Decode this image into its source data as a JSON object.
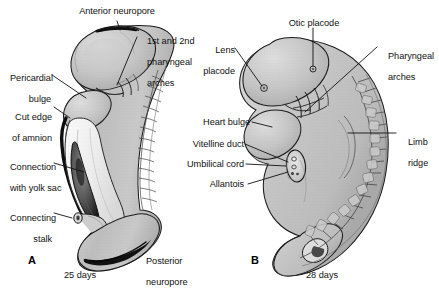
{
  "figure": {
    "background": "#ffffff",
    "ink": "#111111",
    "panels": [
      {
        "id": "A",
        "letter": "A",
        "caption": "25 days",
        "labels": [
          {
            "key": "anterior_neuropore",
            "text": "Anterior neuropore"
          },
          {
            "key": "pharyngeal_arches_1_2",
            "text": "1st and 2nd\npharyngeal\narches"
          },
          {
            "key": "pericardial_bulge",
            "text": "Pericardial\nbulge"
          },
          {
            "key": "cut_edge_of_amnion",
            "text": "Cut edge\nof amnion"
          },
          {
            "key": "connection_with_yolk_sac",
            "text": "Connection\nwith yolk sac"
          },
          {
            "key": "connecting_stalk",
            "text": "Connecting\nstalk"
          },
          {
            "key": "posterior_neuropore",
            "text": "Posterior\nneuropore"
          }
        ]
      },
      {
        "id": "B",
        "letter": "B",
        "caption": "28 days",
        "labels": [
          {
            "key": "otic_placode",
            "text": "Otic placode"
          },
          {
            "key": "lens_placode",
            "text": "Lens\nplacode"
          },
          {
            "key": "pharyngeal_arches",
            "text": "Pharyngeal\narches"
          },
          {
            "key": "heart_bulge",
            "text": "Heart bulge"
          },
          {
            "key": "vitelline_duct",
            "text": "Vitelline duct"
          },
          {
            "key": "umbilical_cord",
            "text": "Umbilical cord"
          },
          {
            "key": "allantois",
            "text": "Allantois"
          },
          {
            "key": "limb_ridge",
            "text": "Limb\nridge"
          }
        ]
      }
    ]
  },
  "panelA": {
    "letter": "A",
    "days": "25 days",
    "anterior_neuropore": "Anterior neuropore",
    "pharyngeal_arches_line1": "1st and 2nd",
    "pharyngeal_arches_line2": "pharyngeal",
    "pharyngeal_arches_line3": "arches",
    "pericardial_line1": "Pericardial",
    "pericardial_line2": "bulge",
    "cut_edge_line1": "Cut edge",
    "cut_edge_line2": "of amnion",
    "yolk_sac_line1": "Connection",
    "yolk_sac_line2": "with yolk sac",
    "connecting_stalk_line1": "Connecting",
    "connecting_stalk_line2": "stalk",
    "posterior_line1": "Posterior",
    "posterior_line2": "neuropore"
  },
  "panelB": {
    "letter": "B",
    "days": "28 days",
    "otic_placode": "Otic placode",
    "lens_line1": "Lens",
    "lens_line2": "placode",
    "pharyngeal_line1": "Pharyngeal",
    "pharyngeal_line2": "arches",
    "heart_bulge": "Heart bulge",
    "vitelline_duct": "Vitelline duct",
    "umbilical_cord": "Umbilical cord",
    "allantois": "Allantois",
    "limb_line1": "Limb",
    "limb_line2": "ridge"
  }
}
